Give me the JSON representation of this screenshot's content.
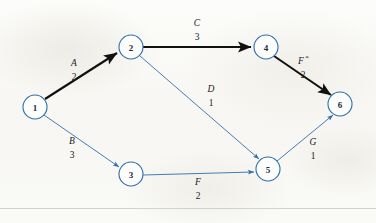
{
  "figure": {
    "kind": "activity-network-diagram",
    "background_color": "#fbfbf9",
    "node_stroke_color": "#2e6fad",
    "node_fill_color": "#fdfdfb",
    "critical_edge_color": "#111111",
    "normal_edge_color": "#2e6fad",
    "footer_rule_color": "#c9c9c2"
  },
  "nodes": [
    {
      "id": "1",
      "label": "1",
      "cx": 35,
      "cy": 107,
      "r": 12
    },
    {
      "id": "2",
      "label": "2",
      "cx": 131,
      "cy": 47,
      "r": 12
    },
    {
      "id": "3",
      "label": "3",
      "cx": 131,
      "cy": 174,
      "r": 12
    },
    {
      "id": "4",
      "label": "4",
      "cx": 266,
      "cy": 47,
      "r": 12
    },
    {
      "id": "5",
      "label": "5",
      "cx": 268,
      "cy": 169,
      "r": 12
    },
    {
      "id": "6",
      "label": "6",
      "cx": 340,
      "cy": 104,
      "r": 12
    }
  ],
  "edges": [
    {
      "id": "A",
      "from": "1",
      "to": "2",
      "activity": "A",
      "duration": "2",
      "critical": true,
      "label_x": 74,
      "label_letter_y": 66,
      "label_weight_y": 80
    },
    {
      "id": "B",
      "from": "1",
      "to": "3",
      "activity": "B",
      "duration": "3",
      "critical": false,
      "label_x": 72,
      "label_letter_y": 144,
      "label_weight_y": 158
    },
    {
      "id": "C",
      "from": "2",
      "to": "4",
      "activity": "C",
      "duration": "3",
      "critical": true,
      "label_x": 197,
      "label_letter_y": 26,
      "label_weight_y": 40
    },
    {
      "id": "D",
      "from": "2",
      "to": "5",
      "activity": "D",
      "duration": "1",
      "critical": false,
      "label_x": 211,
      "label_letter_y": 92,
      "label_weight_y": 106
    },
    {
      "id": "F_star",
      "from": "4",
      "to": "6",
      "activity": "F",
      "star": "*",
      "duration": "2",
      "critical": true,
      "label_x": 303,
      "label_letter_y": 64,
      "label_weight_y": 78
    },
    {
      "id": "F",
      "from": "3",
      "to": "5",
      "activity": "F",
      "duration": "2",
      "critical": false,
      "label_x": 198,
      "label_letter_y": 185,
      "label_weight_y": 199
    },
    {
      "id": "G",
      "from": "5",
      "to": "6",
      "activity": "G",
      "duration": "1",
      "critical": false,
      "label_x": 313,
      "label_letter_y": 145,
      "label_weight_y": 159
    }
  ]
}
